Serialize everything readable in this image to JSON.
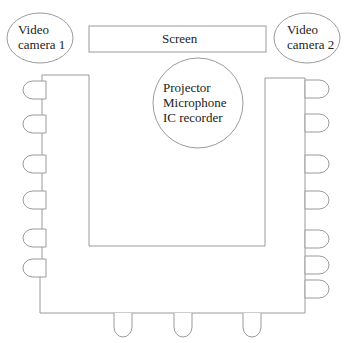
{
  "diagram": {
    "video_camera_1": {
      "line1": "Video",
      "line2": "camera 1"
    },
    "video_camera_2": {
      "line1": "Video",
      "line2": "camera 2"
    },
    "screen": {
      "label": "Screen"
    },
    "center_equipment": {
      "line1": "Projector",
      "line2": "Microphone",
      "line3": "IC recorder"
    },
    "table": {
      "shape": "U-shaped table"
    },
    "seats": {
      "left_side_count": 6,
      "right_side_count": 7,
      "bottom_count": 3
    },
    "colors": {
      "stroke": "#9a9a9a",
      "text": "#222222",
      "background": "#ffffff"
    }
  }
}
